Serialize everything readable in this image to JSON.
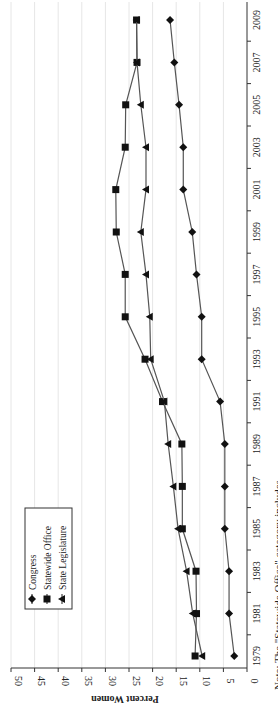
{
  "chart_data": {
    "type": "line",
    "orientation": "rotated-90",
    "title": "",
    "xlabel": "",
    "ylabel": "Percent Women",
    "ylim": [
      0,
      50
    ],
    "yticks": [
      0,
      5,
      10,
      15,
      20,
      25,
      30,
      35,
      40,
      45,
      50
    ],
    "grid": true,
    "legend_position": "inside-top-left",
    "categories": [
      "1979",
      "1981",
      "1983",
      "1985",
      "1987",
      "1989",
      "1991",
      "1993",
      "1995",
      "1997",
      "1999",
      "2001",
      "2003",
      "2005",
      "2007",
      "2009"
    ],
    "series": [
      {
        "name": "Congress",
        "marker": "diamond",
        "values": [
          2.7,
          3.8,
          3.8,
          4.7,
          4.7,
          4.7,
          5.7,
          9.6,
          9.6,
          10.7,
          11.6,
          13.5,
          13.5,
          14.4,
          15.4,
          16.3
        ]
      },
      {
        "name": "Statewide Office",
        "marker": "square",
        "values": [
          11.0,
          10.7,
          10.8,
          13.7,
          13.7,
          13.8,
          17.9,
          21.6,
          25.8,
          25.8,
          27.7,
          27.8,
          25.8,
          25.7,
          23.3,
          23.4
        ]
      },
      {
        "name": "State Legislature",
        "marker": "triangle",
        "values": [
          9.5,
          11.5,
          12.8,
          14.6,
          15.6,
          16.7,
          17.5,
          20.4,
          20.6,
          21.4,
          22.5,
          21.4,
          21.4,
          22.5,
          23.3,
          23.4
        ]
      }
    ]
  },
  "note": "Note: The \"Statewide Office\" category includes"
}
